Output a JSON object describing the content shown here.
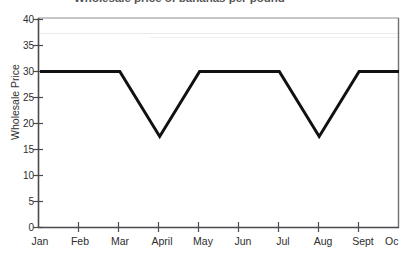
{
  "chart_data": {
    "type": "line",
    "title": "Wholesale price of bananas per pound",
    "xlabel": "",
    "ylabel": "Wholesale Price",
    "categories": [
      "Jan",
      "Feb",
      "Mar",
      "April",
      "May",
      "Jun",
      "Jul",
      "Aug",
      "Sept",
      "Oct"
    ],
    "values": [
      30,
      30,
      30,
      17.5,
      30,
      30,
      30,
      17.5,
      30,
      30
    ],
    "series": [
      {
        "name": "Wholesale Price",
        "values": [
          30,
          30,
          30,
          17.5,
          30,
          30,
          30,
          17.5,
          30,
          30
        ]
      }
    ],
    "ylim": [
      0,
      40
    ],
    "yticks": [
      0,
      5,
      10,
      15,
      20,
      25,
      30,
      35,
      40
    ],
    "ytick_labels": [
      "0",
      "5",
      "10",
      "15",
      "20",
      "25",
      "30",
      "35",
      "40"
    ],
    "grid": false,
    "legend": "none",
    "line_color": "#111111",
    "line_width": 3,
    "background_color": "#ffffff"
  },
  "axes": {
    "y_axis_title": "Wholesale Price",
    "x_axis_labels": [
      "Jan",
      "Feb",
      "Mar",
      "April",
      "May",
      "Jun",
      "Jul",
      "Aug",
      "Sept",
      "Oc"
    ],
    "y_axis_labels": [
      "40",
      "35",
      "30",
      "25",
      "20",
      "15",
      "10",
      "5",
      "0"
    ]
  }
}
